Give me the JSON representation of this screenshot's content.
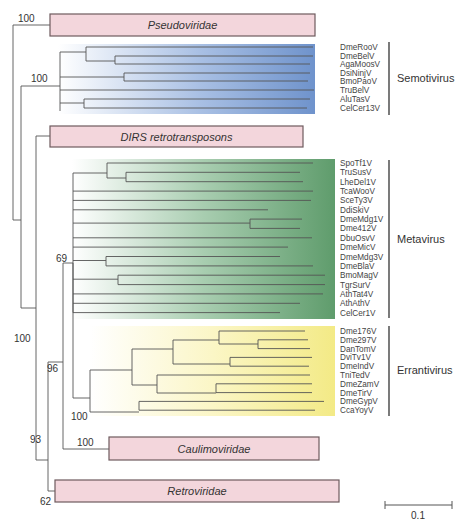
{
  "colors": {
    "box_fill": "#f3d6dc",
    "box_stroke": "#6e5a5e",
    "semotivirus": "#7397cf",
    "metavirus": "#6ea87a",
    "errantivirus": "#f4ee9a",
    "line": "#555555"
  },
  "collapsed_clades": [
    {
      "name": "Pseudoviridae",
      "x": 50,
      "y": 14,
      "w": 265,
      "h": 22,
      "bootstrap": "100"
    },
    {
      "name": "DIRS retrotransposons",
      "x": 50,
      "y": 126,
      "w": 253,
      "h": 21
    },
    {
      "name": "Caulimoviridae",
      "x": 109,
      "y": 437,
      "w": 210,
      "h": 23,
      "bootstrap": "100"
    },
    {
      "name": "Retroviridae",
      "x": 55,
      "y": 480,
      "w": 284,
      "h": 22,
      "bootstrap": "62"
    }
  ],
  "groups": [
    {
      "name": "Semotivirus",
      "bootstrap": "100",
      "leaves": [
        "DmeRooV",
        "DmeBelV",
        "AgaMoosV",
        "DsiNinjV",
        "BmoPaoV",
        "TruBelV",
        "AluTasV",
        "CelCer13V"
      ]
    },
    {
      "name": "Metavirus",
      "bootstrap": "69",
      "leaves": [
        "SpoTf1V",
        "TruSusV",
        "LheDel1V",
        "TcaWooV",
        "SceTy3V",
        "DdiSkiV",
        "DmeMdg1V",
        "Dme412V",
        "DbuOsvV",
        "DmeMicV",
        "DmeMdg3V",
        "DmeBlaV",
        "BmoMagV",
        "TgrSurV",
        "AthTat4V",
        "AthAthV",
        "CelCer1V"
      ]
    },
    {
      "name": "Errantivirus",
      "bootstrap": "100",
      "leaves": [
        "Dme176V",
        "Dme297V",
        "DanTomV",
        "DviTv1V",
        "DmeIndV",
        "TniTedV",
        "DmeZamV",
        "DmeTirV",
        "DmeGypV",
        "CcaYoyV"
      ]
    }
  ],
  "internal_bootstraps": [
    {
      "value": "100",
      "x": 14,
      "y": 342
    },
    {
      "value": "96",
      "x": 47,
      "y": 372
    },
    {
      "value": "93",
      "x": 30,
      "y": 443
    }
  ],
  "scale_bar": {
    "label": "0.1",
    "x1": 385,
    "x2": 452,
    "y": 505
  }
}
